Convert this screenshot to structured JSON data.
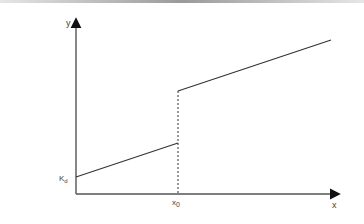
{
  "diagram": {
    "axis_labels": {
      "x": "x",
      "y": "y"
    },
    "intercept_label": {
      "main": "K",
      "sub": "d"
    },
    "discontinuity_label": {
      "main": "x",
      "sub": "0"
    },
    "colors": {
      "line": "#333333",
      "axis": "#333333",
      "dashed": "#333333",
      "topbar": "#9a9a9a"
    },
    "segments": [
      {
        "name": "lower-segment",
        "from": [
          76,
          177
        ],
        "to": [
          178,
          143
        ]
      },
      {
        "name": "upper-segment",
        "from": [
          178,
          91
        ],
        "to": [
          331,
          40
        ]
      }
    ]
  }
}
